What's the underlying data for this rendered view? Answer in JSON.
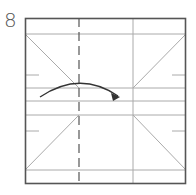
{
  "step": {
    "number": "8"
  },
  "colors": {
    "border": "#555555",
    "crease": "#aaaaaa",
    "fold_line": "#555555",
    "arrow": "#333333",
    "background": "#ffffff"
  },
  "paper": {
    "shape": "square",
    "x": 25,
    "y": 18,
    "width": 161,
    "height": 166
  },
  "creases": {
    "horizontal_y": [
      34,
      88,
      101,
      115,
      170
    ],
    "vertical_x": [
      133
    ],
    "diagonals": [
      {
        "from": [
          25,
          34
        ],
        "to": [
          79,
          88
        ]
      },
      {
        "from": [
          186,
          34
        ],
        "to": [
          133,
          88
        ]
      },
      {
        "from": [
          25,
          170
        ],
        "to": [
          79,
          115
        ]
      },
      {
        "from": [
          133,
          115
        ],
        "to": [
          186,
          170
        ]
      }
    ],
    "edge_ticks": [
      {
        "side": "left",
        "y": 75
      },
      {
        "side": "left",
        "y": 131
      },
      {
        "side": "right",
        "y": 75
      },
      {
        "side": "right",
        "y": 131
      }
    ]
  },
  "valley_fold": {
    "style": "dashed",
    "x": 79
  },
  "arrow": {
    "type": "fold-over",
    "from": [
      40,
      97
    ],
    "to": [
      120,
      97
    ],
    "direction": "right"
  }
}
